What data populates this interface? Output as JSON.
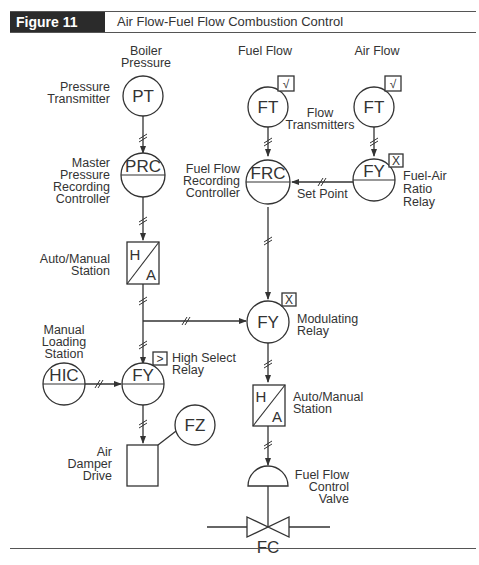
{
  "header": {
    "figure_label": "Figure 11",
    "title": "Air Flow-Fuel Flow Combustion Control"
  },
  "colors": {
    "header_bg": "#2b2b2b",
    "header_text": "#ffffff",
    "line": "#333333",
    "text": "#333333"
  },
  "instruments": {
    "pt": "PT",
    "prc": "PRC",
    "ft_fuel": "FT",
    "ft_air": "FT",
    "frc": "FRC",
    "fy_ratio": "FY",
    "fy_mod": "FY",
    "fy_high": "FY",
    "hic": "HIC",
    "fz": "FZ",
    "fc": "FC"
  },
  "function_blocks": {
    "sqrt_fuel": "√",
    "sqrt_air": "√",
    "multiply_ratio": "X",
    "multiply_mod": "X",
    "high_select": ">"
  },
  "stations": {
    "am1_top": "H",
    "am1_bottom": "A",
    "am2_top": "H",
    "am2_bottom": "A"
  },
  "labels": {
    "boiler_pressure": [
      "Boiler",
      "Pressure"
    ],
    "pressure_transmitter": [
      "Pressure",
      "Transmitter"
    ],
    "master_prc": [
      "Master",
      "Pressure",
      "Recording",
      "Controller"
    ],
    "fuel_flow": "Fuel Flow",
    "air_flow": "Air Flow",
    "flow_transmitters": [
      "Flow",
      "Transmitters"
    ],
    "fuel_flow_recording_controller": [
      "Fuel Flow",
      "Recording",
      "Controller"
    ],
    "set_point": "Set Point",
    "fuel_air_ratio_relay": [
      "Fuel-Air",
      "Ratio",
      "Relay"
    ],
    "auto_manual_station_1": [
      "Auto/Manual",
      "Station"
    ],
    "modulating_relay": [
      "Modulating",
      "Relay"
    ],
    "manual_loading_station": [
      "Manual",
      "Loading",
      "Station"
    ],
    "high_select_relay": [
      "High Select",
      "Relay"
    ],
    "auto_manual_station_2": [
      "Auto/Manual",
      "Station"
    ],
    "air_damper_drive": [
      "Air",
      "Damper",
      "Drive"
    ],
    "fuel_flow_control_valve": [
      "Fuel Flow",
      "Control",
      "Valve"
    ]
  }
}
